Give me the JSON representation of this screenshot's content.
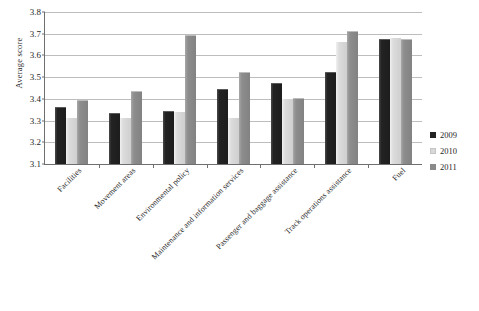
{
  "chart_data": {
    "type": "bar",
    "title": "",
    "xlabel": "",
    "ylabel": "Average score",
    "ylim": [
      3.1,
      3.8
    ],
    "yticks": [
      3.1,
      3.2,
      3.3,
      3.4,
      3.5,
      3.6,
      3.7,
      3.8
    ],
    "ytick_labels": [
      "3.1",
      "3.2",
      "3.3",
      "3.4",
      "3.5",
      "3.6",
      "3.7",
      "3.8"
    ],
    "grid": true,
    "legend_position": "right",
    "categories": [
      "Facilities",
      "Movement areas",
      "Environmental policy",
      "Maintenance and information services",
      "Passenger and baggage assistance",
      "Track operations assistance",
      "Fuel"
    ],
    "series": [
      {
        "name": "2009",
        "color": "#232323",
        "values": [
          3.36,
          3.33,
          3.34,
          3.44,
          3.47,
          3.52,
          3.67
        ]
      },
      {
        "name": "2010",
        "color": "#d8d8d8",
        "values": [
          3.31,
          3.31,
          3.34,
          3.31,
          3.4,
          3.66,
          3.68
        ]
      },
      {
        "name": "2011",
        "color": "#8a8a8a",
        "values": [
          3.39,
          3.43,
          3.69,
          3.52,
          3.4,
          3.71,
          3.67
        ]
      }
    ]
  },
  "caption": {
    "text": ""
  }
}
